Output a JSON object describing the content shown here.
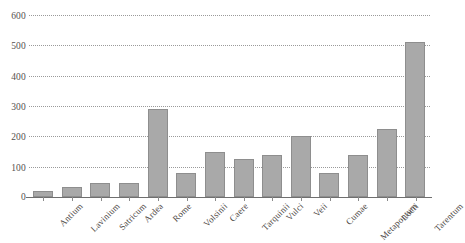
{
  "chart_data": {
    "type": "bar",
    "title": "",
    "subtitle": "",
    "xlabel": "",
    "ylabel": "",
    "ylim": [
      0,
      600
    ],
    "yticks": [
      0,
      100,
      200,
      300,
      400,
      500,
      600
    ],
    "grid": true,
    "legend": false,
    "legend_position": "none",
    "bar_color": "#a9a9a9",
    "bar_edge_color": "#8e8e8e",
    "gridline_color": "#9a9a9a",
    "axis_color": "#6f6f6f",
    "background_color": "#ffffff",
    "categories": [
      "Antium",
      "Lavinium",
      "Satricum",
      "Ardea",
      "Rome",
      "Volsinii",
      "Caere",
      "Tarquinii",
      "Vulci",
      "Veii",
      "Cumae",
      "Metapontum",
      "Locri",
      "Tarentum"
    ],
    "values": [
      20,
      32,
      45,
      45,
      290,
      80,
      150,
      125,
      140,
      200,
      80,
      140,
      225,
      510
    ]
  }
}
